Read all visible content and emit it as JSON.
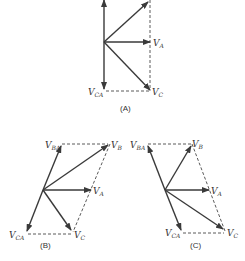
{
  "diagrams": [
    {
      "id": "A",
      "caption": "(A)",
      "labels": {
        "va": {
          "main": "V",
          "sub": "A"
        },
        "vc": {
          "main": "V",
          "sub": "C"
        },
        "vca": {
          "main": "V",
          "sub": "CA"
        }
      }
    },
    {
      "id": "B",
      "caption": "(B)",
      "labels": {
        "vba": {
          "main": "V",
          "sub": "BA"
        },
        "vb": {
          "main": "V",
          "sub": "B"
        },
        "va": {
          "main": "V",
          "sub": "A"
        },
        "vc": {
          "main": "V",
          "sub": "C"
        },
        "vca": {
          "main": "V",
          "sub": "CA"
        }
      }
    },
    {
      "id": "C",
      "caption": "(C)",
      "labels": {
        "vba": {
          "main": "V",
          "sub": "BA"
        },
        "vb": {
          "main": "V",
          "sub": "B"
        },
        "va": {
          "main": "V",
          "sub": "A"
        },
        "vc": {
          "main": "V",
          "sub": "C"
        },
        "vca": {
          "main": "V",
          "sub": "CA"
        }
      }
    }
  ],
  "colors": {
    "ink": "#3a3a3a",
    "background": "#ffffff"
  }
}
